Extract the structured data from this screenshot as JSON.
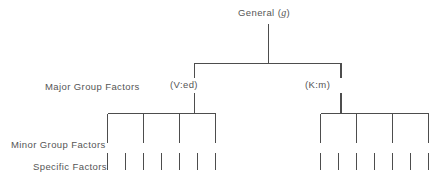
{
  "diagram": {
    "title_node": {
      "prefix": "General (",
      "symbol": "g",
      "suffix": ")",
      "full_text": "General (g)"
    },
    "row_labels": {
      "major": "Major Group Factors",
      "minor": "Minor Group Factors",
      "specific": "Specific Factors"
    },
    "major_factors": [
      {
        "label": "(V:ed)",
        "side": "left"
      },
      {
        "label": "(K:m)",
        "side": "right"
      }
    ],
    "counts": {
      "minor_left": 4,
      "minor_right": 4,
      "specific_left": 7,
      "specific_right": 7
    },
    "colors": {
      "line": "#4d4d4d",
      "text": "#555555",
      "background": "#ffffff"
    }
  }
}
